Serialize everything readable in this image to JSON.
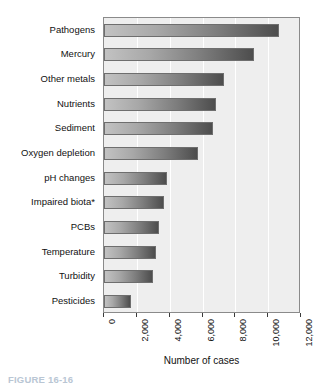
{
  "chart_data": {
    "type": "bar",
    "orientation": "horizontal",
    "title": "",
    "xlabel": "Number of cases",
    "ylabel": "",
    "xlim": [
      0,
      12000
    ],
    "grid": true,
    "legend": null,
    "categories": [
      "Pathogens",
      "Mercury",
      "Other metals",
      "Nutrients",
      "Sediment",
      "Oxygen depletion",
      "pH changes",
      "Impaired biota*",
      "PCBs",
      "Temperature",
      "Turbidity",
      "Pesticides"
    ],
    "values": [
      10660,
      9140,
      7310,
      6820,
      6640,
      5730,
      3840,
      3650,
      3350,
      3170,
      2980,
      1640
    ],
    "xticks": [
      0,
      2000,
      4000,
      6000,
      8000,
      10000,
      12000
    ],
    "xticklabels": [
      "0",
      "2,000",
      "4,000",
      "6,000",
      "8,000",
      "10,000",
      "12,000"
    ],
    "bar_gradient_start": "#c2c2c2",
    "bar_gradient_end": "#4d4d4d",
    "plot_background": "#eeeeee",
    "gridline_color": "#ffffff",
    "frame_color": "#8a8a8a"
  },
  "caption": {
    "text": "FIGURE 16-16"
  }
}
